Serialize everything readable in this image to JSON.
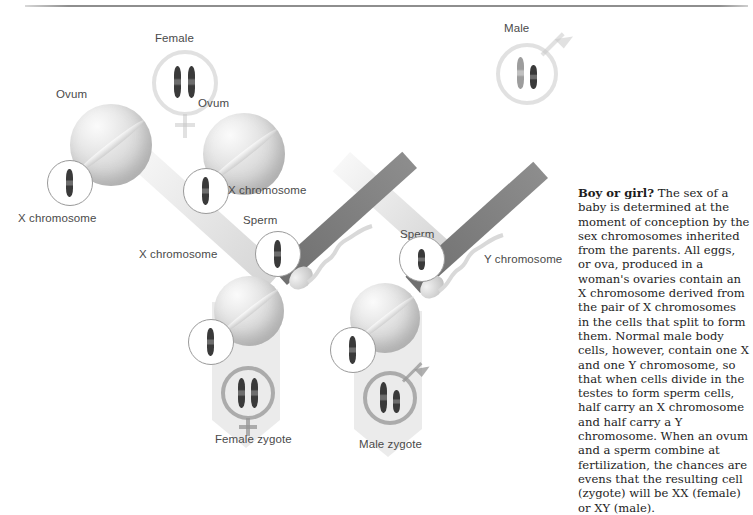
{
  "figure": {
    "title_lead": "Boy or girl?",
    "caption_body": " The sex of a baby is determined at the moment of conception by the sex chromosomes inherited from the parents. All eggs, or ova, produced in a woman's ovaries contain an X chromosome derived from the pair of X chromosomes in the cells that split to form them. Normal male body cells, however, contain one X and one Y chromosome, so that when cells divide in the testes to form sperm cells, half carry an X chromosome and half carry a Y chromosome. When an ovum and a sperm combine at fertilization, the chances are evens that the resulting cell (zygote) will be XX (female) or XY (male)."
  },
  "labels": {
    "female_symbol": "Female",
    "male_symbol": "Male",
    "ovum_left": "Ovum",
    "ovum_right": "Ovum",
    "x_chromosome_ovum_left": "X chromosome",
    "x_chromosome_ovum_right": "X chromosome",
    "sperm_left": "Sperm",
    "sperm_right": "Sperm",
    "x_chromosome_sperm": "X chromosome",
    "y_chromosome_sperm": "Y chromosome",
    "female_zygote": "Female zygote",
    "male_zygote": "Male zygote"
  },
  "colors": {
    "chromosome_dark": "#3a3a3a",
    "chromosome_light": "#9d9d9d",
    "sperm_band": "#6f6f6f",
    "ovum_band": "#d0d0d0",
    "label_text": "#4a4a4a",
    "caption_text": "#1d1d1d",
    "rule": "#8e8e8e",
    "background": "#ffffff"
  },
  "genetics": {
    "female_parent_chromosomes": "XX",
    "male_parent_chromosomes": "XY",
    "ovum_chromosome": "X",
    "sperm_left_chromosome": "X",
    "sperm_right_chromosome": "Y",
    "female_zygote_chromosomes": "XX",
    "male_zygote_chromosomes": "XY"
  }
}
